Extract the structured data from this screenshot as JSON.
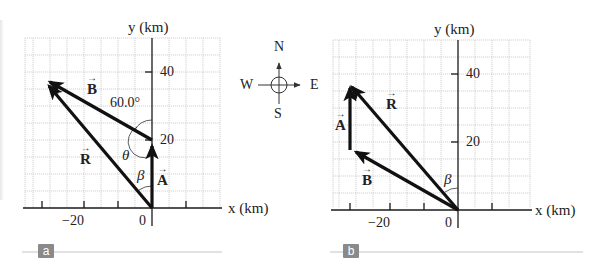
{
  "panels": [
    {
      "id": "a",
      "tag": "a",
      "x_axis_label": "x (km)",
      "y_axis_label": "y (km)",
      "x_ticks": [
        "−20",
        "0"
      ],
      "y_ticks": [
        "40",
        "20"
      ],
      "vectors": {
        "A": {
          "label": "A",
          "from": [
            0,
            0
          ],
          "to": [
            0,
            20
          ]
        },
        "B": {
          "label": "B",
          "from": [
            0,
            20
          ],
          "to": [
            -30.3,
            37.5
          ]
        },
        "R": {
          "label": "R",
          "from": [
            0,
            0
          ],
          "to": [
            -30.3,
            37.5
          ]
        }
      },
      "angles": {
        "angle_label": "60.0°",
        "theta": "θ",
        "beta": "β"
      }
    },
    {
      "id": "b",
      "tag": "b",
      "x_axis_label": "x (km)",
      "y_axis_label": "y (km)",
      "x_ticks": [
        "−20",
        "0"
      ],
      "y_ticks": [
        "40",
        "20"
      ],
      "vectors": {
        "B": {
          "label": "B",
          "from": [
            0,
            0
          ],
          "to": [
            -30.3,
            17.5
          ]
        },
        "A": {
          "label": "A",
          "from": [
            -30.3,
            17.5
          ],
          "to": [
            -30.3,
            37.5
          ]
        },
        "R": {
          "label": "R",
          "from": [
            0,
            0
          ],
          "to": [
            -30.3,
            37.5
          ]
        }
      },
      "angles": {
        "beta": "β"
      }
    }
  ],
  "compass": {
    "north": "N",
    "south": "S",
    "east": "E",
    "west": "W"
  },
  "vector_arrow_glyph": "→",
  "colors": {
    "grid": "#c8c8c8",
    "axis": "#1a1a1a",
    "vector": "#111111",
    "tag_bg": "#8a8a8a"
  }
}
